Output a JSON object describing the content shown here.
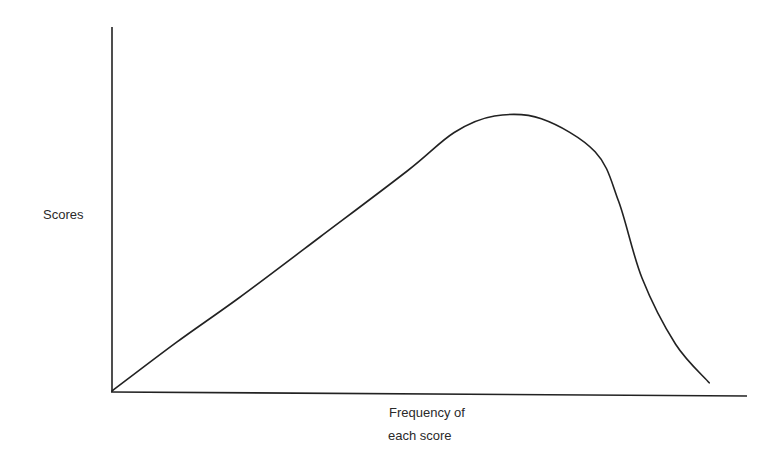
{
  "chart_data": {
    "type": "line",
    "title": "",
    "xlabel_lines": [
      "Frequency of",
      "each score"
    ],
    "ylabel": "Scores",
    "grid": false,
    "legend": "none",
    "ticks": "none",
    "xlim": [
      0,
      1
    ],
    "ylim": [
      0,
      1
    ],
    "series": [
      {
        "name": "curve",
        "color": "#222222",
        "points": [
          [
            0.0,
            0.0
          ],
          [
            0.095,
            0.175
          ],
          [
            0.19,
            0.34
          ],
          [
            0.31,
            0.56
          ],
          [
            0.44,
            0.8
          ],
          [
            0.51,
            0.94
          ],
          [
            0.57,
            1.0
          ],
          [
            0.64,
            0.99
          ],
          [
            0.72,
            0.87
          ],
          [
            0.755,
            0.69
          ],
          [
            0.79,
            0.41
          ],
          [
            0.84,
            0.17
          ],
          [
            0.89,
            0.03
          ]
        ]
      }
    ]
  }
}
